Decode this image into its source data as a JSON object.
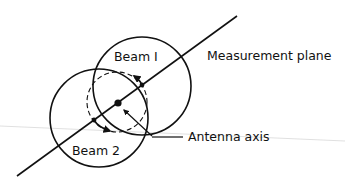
{
  "diagram": {
    "labels": {
      "beam1": "Beam I",
      "beam2": "Beam 2",
      "measurement_plane": "Measurement plane",
      "antenna_axis": "Antenna axis"
    },
    "colors": {
      "stroke": "#111111",
      "background": "#ffffff",
      "artifact_line": "#d8d8d8"
    }
  }
}
